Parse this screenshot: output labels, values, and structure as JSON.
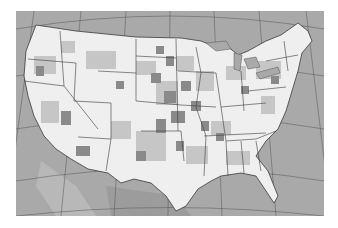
{
  "map": {
    "type": "choropleth",
    "region": "Contiguous United States",
    "unit": "county",
    "projection": "conic (Albers-like) with graticule",
    "colors": {
      "water": "#a9a9a9",
      "land_low": "#f2f2f2",
      "land_mid": "#c9c9c9",
      "land_high": "#8a8a8a",
      "borders": "#3a3a3a",
      "graticule": "#555555",
      "background": "#ffffff"
    },
    "legend": null,
    "caption": ""
  }
}
